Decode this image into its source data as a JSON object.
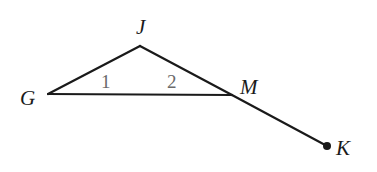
{
  "diagram": {
    "colors": {
      "stroke": "#1a1a1a",
      "angle_label": "#6a6a6a",
      "background": "#ffffff"
    },
    "points": {
      "G": {
        "label": "G",
        "x": 48,
        "y": 94
      },
      "J": {
        "label": "J",
        "x": 140,
        "y": 46
      },
      "M": {
        "label": "M",
        "x": 232,
        "y": 95
      },
      "K": {
        "label": "K",
        "x": 327,
        "y": 146
      }
    },
    "segments": [
      {
        "from": "G",
        "to": "J"
      },
      {
        "from": "J",
        "to": "M"
      },
      {
        "from": "G",
        "to": "M"
      },
      {
        "from": "M",
        "to": "K"
      }
    ],
    "angles": [
      {
        "label": "1",
        "vertex": "G"
      },
      {
        "label": "2",
        "vertex": "M"
      }
    ],
    "endpoint_dot": "K"
  }
}
